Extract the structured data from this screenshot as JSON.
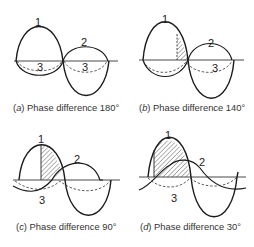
{
  "figure": {
    "panels": [
      {
        "id": "a",
        "letter": "a",
        "caption_prefix": "(",
        "caption_suffix": ") Phase difference 180°",
        "phase_difference_deg": 180,
        "curve_labels": {
          "wave1": "1",
          "wave2": "2",
          "wave3a": "3",
          "wave3b": "3"
        }
      },
      {
        "id": "b",
        "letter": "b",
        "caption_prefix": "(",
        "caption_suffix": ") Phase difference 140°",
        "phase_difference_deg": 140,
        "curve_labels": {
          "wave1": "1",
          "wave2": "2",
          "wave3": "3"
        }
      },
      {
        "id": "c",
        "letter": "c",
        "caption_prefix": "(",
        "caption_suffix": ") Phase difference 90°",
        "phase_difference_deg": 90,
        "curve_labels": {
          "wave1": "1",
          "wave2": "2",
          "wave3": "3"
        }
      },
      {
        "id": "d",
        "letter": "d",
        "caption_prefix": "(",
        "caption_suffix": ") Phase difference 30°",
        "phase_difference_deg": 30,
        "curve_labels": {
          "wave1": "1",
          "wave2": "2",
          "wave3": "3"
        }
      }
    ],
    "colors": {
      "line": "#1a1a1a",
      "background": "#ffffff",
      "hatch": "#444444"
    }
  }
}
